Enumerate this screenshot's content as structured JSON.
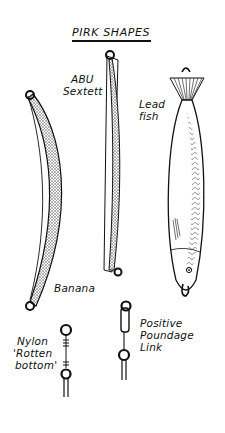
{
  "title": "PIRK SHAPES",
  "lures": [
    {
      "id": "banana",
      "label": "Banana"
    },
    {
      "id": "abu-sextett",
      "label_line1": "ABU",
      "label_line2": "Sextett"
    },
    {
      "id": "lead-fish",
      "label_line1": "Lead",
      "label_line2": "fish"
    }
  ],
  "attachments": [
    {
      "id": "nylon-rotten-bottom",
      "label_line1": "Nylon",
      "label_line2": "'Rotten",
      "label_line3": "bottom'"
    },
    {
      "id": "positive-poundage-link",
      "label_line1": "Positive",
      "label_line2": "Poundage",
      "label_line3": "Link"
    }
  ],
  "colors": {
    "ink": "#111111",
    "paper": "#ffffff",
    "stipple": "#555555"
  }
}
